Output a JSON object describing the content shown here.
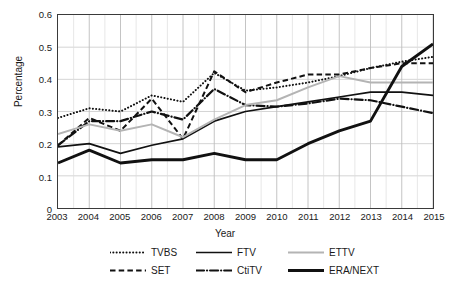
{
  "chart_data": {
    "type": "line",
    "title": "",
    "xlabel": "Year",
    "ylabel": "Percentage",
    "x": [
      2003,
      2004,
      2005,
      2006,
      2007,
      2008,
      2009,
      2010,
      2011,
      2012,
      2013,
      2014,
      2015
    ],
    "xticklabels": [
      "2003",
      "2004",
      "2005",
      "2006",
      "2007",
      "2008",
      "2009",
      "2010",
      "2011",
      "2012",
      "2013",
      "2014",
      "2015"
    ],
    "yticklabels": [
      "0",
      "0.1",
      "0.2",
      "0.3",
      "0.4",
      "0.5",
      "0.6"
    ],
    "yticks": [
      0,
      0.1,
      0.2,
      0.3,
      0.4,
      0.5,
      0.6
    ],
    "ylim": [
      0,
      0.6
    ],
    "xlim": [
      2003,
      2015
    ],
    "grid": true,
    "grid_minor_x": true,
    "legend_position": "bottom",
    "legend_ncol": 3,
    "series": [
      {
        "name": "TVBS",
        "style": "dotted",
        "color": "#111111",
        "width": 2.0,
        "values": [
          0.28,
          0.31,
          0.3,
          0.35,
          0.33,
          0.42,
          0.365,
          0.375,
          0.39,
          0.41,
          0.435,
          0.455,
          0.47
        ]
      },
      {
        "name": "SET",
        "style": "dashed",
        "color": "#111111",
        "width": 2.0,
        "values": [
          0.195,
          0.28,
          0.24,
          0.34,
          0.215,
          0.425,
          0.36,
          0.39,
          0.415,
          0.415,
          0.435,
          0.45,
          0.45
        ]
      },
      {
        "name": "FTV",
        "style": "solid",
        "color": "#111111",
        "width": 1.7,
        "values": [
          0.19,
          0.2,
          0.17,
          0.195,
          0.215,
          0.27,
          0.3,
          0.315,
          0.33,
          0.345,
          0.36,
          0.36,
          0.35
        ]
      },
      {
        "name": "CtiTV",
        "style": "dashdot",
        "color": "#111111",
        "width": 2.2,
        "values": [
          0.195,
          0.27,
          0.27,
          0.3,
          0.275,
          0.37,
          0.32,
          0.315,
          0.325,
          0.34,
          0.335,
          0.315,
          0.295
        ]
      },
      {
        "name": "ETTV",
        "style": "solid",
        "color": "#b4b4b4",
        "width": 2.0,
        "values": [
          0.23,
          0.26,
          0.24,
          0.26,
          0.22,
          0.275,
          0.32,
          0.335,
          0.375,
          0.41,
          0.39,
          0.39,
          0.39
        ]
      },
      {
        "name": "ERA/NEXT",
        "style": "solid",
        "color": "#111111",
        "width": 2.9,
        "values": [
          0.14,
          0.18,
          0.14,
          0.15,
          0.15,
          0.17,
          0.15,
          0.15,
          0.2,
          0.24,
          0.27,
          0.44,
          0.51
        ]
      }
    ],
    "legend_order": [
      "TVBS",
      "FTV",
      "ETTV",
      "SET",
      "CtiTV",
      "ERA/NEXT"
    ]
  }
}
